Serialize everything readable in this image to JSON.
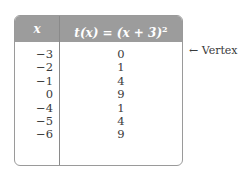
{
  "table": {
    "headers": {
      "x": "x",
      "t_prefix": "t(x) = (x + 3)",
      "t_exponent": "2"
    },
    "rows": [
      {
        "x": "−3",
        "t": "0"
      },
      {
        "x": "−2",
        "t": "1"
      },
      {
        "x": "−1",
        "t": "4"
      },
      {
        "x": "0",
        "t": "9"
      },
      {
        "x": "−4",
        "t": "1"
      },
      {
        "x": "−5",
        "t": "4"
      },
      {
        "x": "−6",
        "t": "9"
      }
    ]
  },
  "annotation": {
    "arrow": "←",
    "label": "Vertex",
    "row_index": 0
  }
}
